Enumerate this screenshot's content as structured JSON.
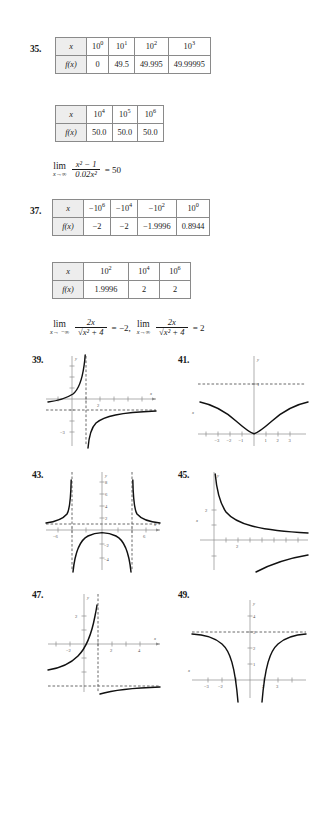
{
  "problems": {
    "p35": {
      "number": "35.",
      "table1": {
        "row_labels": [
          "x",
          "f(x)"
        ],
        "headers": [
          {
            "base": "10",
            "exp": "0"
          },
          {
            "base": "10",
            "exp": "1"
          },
          {
            "base": "10",
            "exp": "2"
          },
          {
            "base": "10",
            "exp": "3"
          }
        ],
        "values": [
          "0",
          "49.5",
          "49.995",
          "49.99995"
        ]
      },
      "table2": {
        "row_labels": [
          "x",
          "f(x)"
        ],
        "headers": [
          {
            "base": "10",
            "exp": "4"
          },
          {
            "base": "10",
            "exp": "5"
          },
          {
            "base": "10",
            "exp": "6"
          }
        ],
        "values": [
          "50.0",
          "50.0",
          "50.0"
        ]
      },
      "limit": {
        "op": "lim",
        "sub": "x→∞",
        "numerator": "x² − 1",
        "denominator": "0.02x²",
        "equals": "= 50"
      }
    },
    "p37": {
      "number": "37.",
      "table1": {
        "row_labels": [
          "x",
          "f(x)"
        ],
        "headers": [
          {
            "base": "−10",
            "exp": "6"
          },
          {
            "base": "−10",
            "exp": "4"
          },
          {
            "base": "−10",
            "exp": "2"
          },
          {
            "base": "10",
            "exp": "0"
          }
        ],
        "values": [
          "−2",
          "−2",
          "−1.9996",
          "0.8944"
        ]
      },
      "table2": {
        "row_labels": [
          "x",
          "f(x)"
        ],
        "headers": [
          {
            "base": "10",
            "exp": "2"
          },
          {
            "base": "10",
            "exp": "4"
          },
          {
            "base": "10",
            "exp": "6"
          }
        ],
        "values": [
          "1.9996",
          "2",
          "2"
        ]
      },
      "limit1": {
        "op": "lim",
        "sub": "x→ −∞",
        "numerator": "2x",
        "denominator_root": "x² + 4",
        "equals": "= −2,"
      },
      "limit2": {
        "op": "lim",
        "sub": "x→∞",
        "numerator": "2x",
        "denominator_root": "x² + 4",
        "equals": "= 2"
      }
    },
    "p39": {
      "number": "39.",
      "axis_labels": {
        "x": "x",
        "y": "y"
      },
      "x_ticks": [
        "2"
      ],
      "y_ticks": [
        "−3"
      ],
      "vertical_asymptote": 1,
      "horizontal_asymptote": -1
    },
    "p41": {
      "number": "41.",
      "axis_labels": {
        "x": "x",
        "y": "y"
      },
      "x_ticks": [
        "−3",
        "−2",
        "−1",
        "1",
        "2",
        "3"
      ],
      "y_ticks": [
        "1"
      ],
      "horizontal_asymptote": 1
    },
    "p43": {
      "number": "43.",
      "axis_labels": {
        "x": "x",
        "y": "y"
      },
      "x_ticks": [
        "−6",
        "6"
      ],
      "y_ticks": [
        "2",
        "4",
        "6",
        "8",
        "−2",
        "−4"
      ],
      "vertical_asymptotes": [
        -3,
        3
      ],
      "horizontal_asymptote": 1
    },
    "p45": {
      "number": "45.",
      "axis_labels": {
        "x": "x",
        "y": "y"
      },
      "x_ticks": [
        "2"
      ],
      "y_ticks": [
        "2"
      ],
      "vertical_asymptote": 0
    },
    "p47": {
      "number": "47.",
      "axis_labels": {
        "x": "x",
        "y": "y"
      },
      "x_ticks": [
        "−2",
        "2",
        "4"
      ],
      "y_ticks": [
        "2"
      ],
      "vertical_asymptote": 1,
      "horizontal_asymptote": -3
    },
    "p49": {
      "number": "49.",
      "axis_labels": {
        "x": "x",
        "y": "y"
      },
      "x_ticks": [
        "−3",
        "−2",
        "2",
        "3"
      ],
      "y_ticks": [
        "1",
        "2",
        "3",
        "4"
      ],
      "horizontal_asymptote": 3
    }
  }
}
